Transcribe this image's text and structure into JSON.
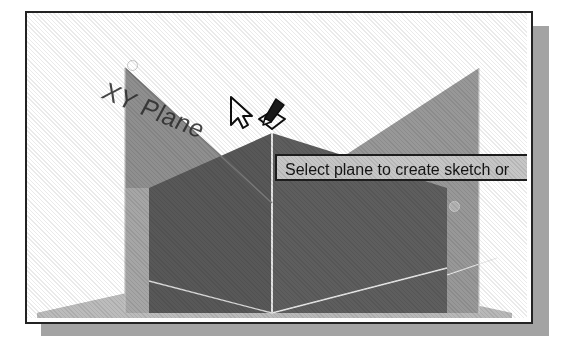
{
  "figure": {
    "kind": "cad-3d-viewport-screenshot",
    "background_color": "#ffffff",
    "frame_border_color": "#232323",
    "frame_shadow_color": "#a3a3a3"
  },
  "viewport": {
    "name": "3D modeling viewport",
    "background_color": "#ffffff",
    "planes": [
      {
        "id": "xy-plane",
        "label": "XY Plane",
        "state": "highlighted",
        "fill_color": "#8f8f8f",
        "description": "front vertical plane, highlighted under cursor"
      },
      {
        "id": "yz-plane",
        "label": "",
        "state": "normal",
        "fill_color": "#959595",
        "description": "right vertical plane rising to the right"
      },
      {
        "id": "xz-plane",
        "label": "",
        "state": "normal",
        "fill_color": "#b5b5b5",
        "description": "horizontal ground plane"
      },
      {
        "id": "solid-body",
        "label": "",
        "state": "normal",
        "fill_color": "#595959",
        "description": "dark shaded solid block in the middle"
      }
    ],
    "plane_label": {
      "text": "XY Plane",
      "color": "#2e2e2e"
    },
    "edge_line_color": "#dcdcdc",
    "grips": [
      {
        "id": "grip-top-left",
        "x": 104,
        "y": 51
      },
      {
        "id": "grip-right",
        "x": 426,
        "y": 192
      }
    ]
  },
  "tooltip": {
    "text": "Select plane to create sketch or",
    "truncated": true,
    "background_color": "#c6c6c6",
    "border_color": "#1d1d1d",
    "text_color": "#141414"
  },
  "cursor": {
    "pointer": "arrow-cursor",
    "badge": "create-sketch-icon",
    "badge_description": "pencil sketching on a diamond-shaped plane"
  }
}
